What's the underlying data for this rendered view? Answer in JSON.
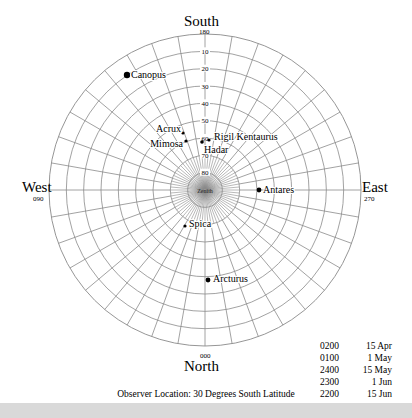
{
  "directions": {
    "south": {
      "label": "South",
      "degrees": "180"
    },
    "north": {
      "label": "North",
      "degrees": "000"
    },
    "west": {
      "label": "West",
      "degrees": "090"
    },
    "east": {
      "label": "East",
      "degrees": "270"
    }
  },
  "center_label": "Zenith",
  "altitude_labels": [
    "10",
    "20",
    "30",
    "40",
    "50",
    "60",
    "70",
    "80"
  ],
  "stars": [
    {
      "name": "Canopus",
      "x": 127,
      "y": 75,
      "size": 3.2
    },
    {
      "name": "Acrux",
      "x": 183,
      "y": 133,
      "size": 1.6
    },
    {
      "name": "Mimosa",
      "x": 186,
      "y": 141,
      "size": 1.6
    },
    {
      "name": "Hadar",
      "x": 202,
      "y": 142,
      "size": 1.8
    },
    {
      "name": "Rigil Kentaurus",
      "x": 209,
      "y": 140,
      "size": 1.6
    },
    {
      "name": "Antares",
      "x": 259,
      "y": 190,
      "size": 2.4
    },
    {
      "name": "Spica",
      "x": 185,
      "y": 226,
      "size": 1.6
    },
    {
      "name": "Arcturus",
      "x": 208,
      "y": 280,
      "size": 2.4
    }
  ],
  "times": [
    {
      "time": "0200",
      "date": "15 Apr"
    },
    {
      "time": "0100",
      "date": "1 May"
    },
    {
      "time": "2400",
      "date": "15 May"
    },
    {
      "time": "2300",
      "date": "1 Jun"
    },
    {
      "time": "2200",
      "date": "15 Jun"
    }
  ],
  "observer": "Observer Location: 30 Degrees South Latitude",
  "colors": {
    "grid": "#8a8a8a",
    "star": "#000000",
    "zenith_glow": "#bdbdbd"
  }
}
